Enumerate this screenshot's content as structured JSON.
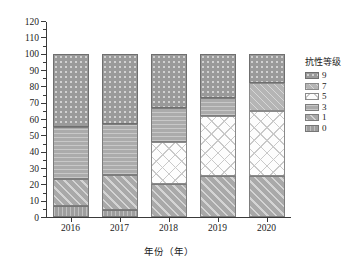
{
  "chart_data": {
    "type": "bar",
    "subtype": "stacked-percentage",
    "title": "",
    "xlabel": "年份（年）",
    "ylabel": "区试品种稻瘟病抗性统计（%）",
    "categories": [
      "2016",
      "2017",
      "2018",
      "2019",
      "2020"
    ],
    "ylim": [
      0,
      120
    ],
    "ytick_step": 10,
    "yticks": [
      "0",
      "10",
      "20",
      "30",
      "40",
      "50",
      "60",
      "70",
      "80",
      "90",
      "100",
      "110",
      "120"
    ],
    "grid": false,
    "legend_position": "right",
    "legend_title": "抗性等级",
    "series": [
      {
        "name": "9",
        "grade": "9",
        "pattern": "dotted-dark-gray",
        "color": "#9a9a9a",
        "values": [
          45,
          43,
          33,
          27,
          18
        ]
      },
      {
        "name": "7",
        "grade": "7",
        "pattern": "diagonal-light-gray",
        "color": "#b5b5b5",
        "values": [
          0,
          0,
          0,
          0,
          17
        ]
      },
      {
        "name": "5",
        "grade": "5",
        "pattern": "crosshatch-white",
        "color": "#fdfdfd",
        "values": [
          0,
          0,
          26,
          37,
          40
        ]
      },
      {
        "name": "3",
        "grade": "3",
        "pattern": "horizontal-mid-gray",
        "color": "#ababab",
        "values": [
          32,
          31,
          21,
          11,
          0
        ]
      },
      {
        "name": "1",
        "grade": "1",
        "pattern": "diagonal-mid-gray",
        "color": "#a9a9a9",
        "values": [
          16,
          22,
          20,
          25,
          25
        ]
      },
      {
        "name": "0",
        "grade": "0",
        "pattern": "vertical-gray",
        "color": "#9e9e9e",
        "values": [
          7,
          4,
          0,
          0,
          0
        ]
      }
    ],
    "stack_breakpoints": {
      "2016": [
        0,
        7,
        23,
        23,
        23,
        55,
        100
      ],
      "2017": [
        0,
        4,
        26,
        26,
        26,
        57,
        100
      ],
      "2018": [
        0,
        0,
        20,
        46,
        46,
        67,
        100
      ],
      "2019": [
        0,
        0,
        25,
        62,
        62,
        73,
        100
      ],
      "2020": [
        0,
        0,
        25,
        65,
        82,
        82,
        100
      ]
    }
  },
  "legend": {
    "title": "抗性等级",
    "items": [
      {
        "label": "9",
        "class": "g9"
      },
      {
        "label": "7",
        "class": "g7"
      },
      {
        "label": "5",
        "class": "g5"
      },
      {
        "label": "3",
        "class": "g3"
      },
      {
        "label": "1",
        "class": "g1"
      },
      {
        "label": "0",
        "class": "g0"
      }
    ]
  },
  "axes": {
    "y_title": "区试品种稻瘟病抗性统计（%）",
    "x_title": "年份（年）"
  }
}
